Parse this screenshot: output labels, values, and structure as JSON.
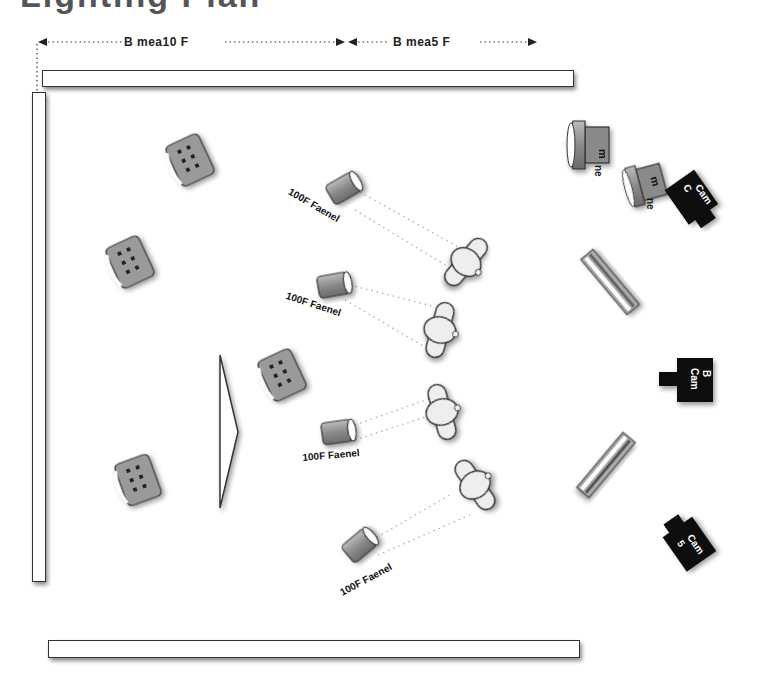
{
  "title_partial": "Lighting Plan",
  "dimensions": [
    {
      "id": "dim-left",
      "label": "B mea10 F"
    },
    {
      "id": "dim-right",
      "label": "B mea5 F"
    }
  ],
  "walls": [
    "top-wall",
    "left-wall",
    "bottom-wall"
  ],
  "ambient_lights": [
    {
      "id": "ambient-1",
      "label": "aFrFC\nmean"
    },
    {
      "id": "ambient-2",
      "label": "aFrFC\nmean"
    },
    {
      "id": "ambient-3",
      "label": "aFrFC\nmean"
    },
    {
      "id": "ambient-4",
      "label": "aFrFC\nmean"
    }
  ],
  "fresnels": [
    {
      "id": "fresnel-1",
      "label": "100F  Faenel"
    },
    {
      "id": "fresnel-2",
      "label": "100F  Faenel"
    },
    {
      "id": "fresnel-3",
      "label": "100F  Faenel"
    },
    {
      "id": "fresnel-4",
      "label": "100F  Faenel"
    }
  ],
  "performers": 4,
  "spotlights": [
    {
      "id": "spot-1",
      "label": "m",
      "sub": "ne"
    },
    {
      "id": "spot-2",
      "label": "m",
      "sub": "ne"
    }
  ],
  "cameras": [
    {
      "id": "cam-c",
      "label": "Cam",
      "letter": "C"
    },
    {
      "id": "cam-b",
      "label": "Cam",
      "letter": "B"
    },
    {
      "id": "cam-a",
      "label": "Cam",
      "letter": "5"
    }
  ],
  "fluorescent_banks": 2,
  "colors": {
    "wall_stroke": "#333333",
    "fixture_fill": "#999999",
    "camera_fill": "#111111",
    "performer_fill": "#eeeeee"
  }
}
